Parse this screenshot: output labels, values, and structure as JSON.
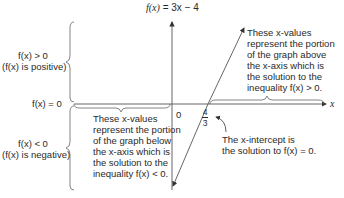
{
  "function_label": {
    "prefix": "f(x)",
    "equals": "= 3x − 4",
    "full": "f(x) = 3x − 4"
  },
  "axis": {
    "x_label": "x",
    "origin_label": "0",
    "x_intercept_num": "4",
    "x_intercept_den": "3"
  },
  "left_labels": {
    "positive_line1": "f(x) > 0",
    "positive_line2": "(f(x) is positive)",
    "zero": "f(x) = 0",
    "negative_line1": "f(x) < 0",
    "negative_line2": "(f(x) is negative)"
  },
  "annotations": {
    "above": [
      "These x-values",
      "represent the portion",
      "of the graph above",
      "the x-axis which is",
      "the solution to the",
      "inequality f(x) > 0."
    ],
    "below": [
      "These x-values",
      "represent the portion",
      "of the graph below",
      "the x-axis which is",
      "the solution to the",
      "inequality f(x) < 0."
    ],
    "intercept": [
      "The x-intercept is",
      "the solution to f(x) = 0."
    ]
  },
  "colors": {
    "line": "#555555",
    "text": "#2a2a2a",
    "background": "#ffffff"
  }
}
